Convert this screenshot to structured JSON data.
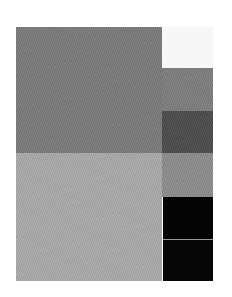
{
  "image": {
    "description": "Grayscale color-swatch test pattern",
    "blocks": [
      {
        "name": "large-gray-block",
        "color": "#7a7a7a"
      },
      {
        "name": "large-light-gray-block",
        "color": "#a9a9a9"
      }
    ],
    "swatches": [
      {
        "name": "white",
        "color": "#f7f7f7"
      },
      {
        "name": "gray",
        "color": "#7d7d7d"
      },
      {
        "name": "dark-gray",
        "color": "#4b4b4b"
      },
      {
        "name": "mid-gray",
        "color": "#8c8c8c"
      },
      {
        "name": "black",
        "color": "#050505"
      },
      {
        "name": "black-2",
        "color": "#060606"
      }
    ]
  }
}
